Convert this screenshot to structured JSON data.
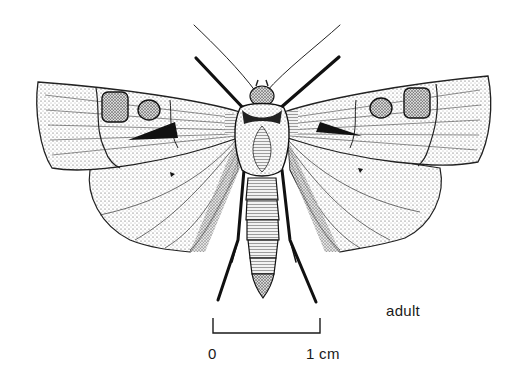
{
  "figure": {
    "view": "dorsal, wings spread",
    "style": "stippled pen-and-ink illustration",
    "stage_label": "adult"
  },
  "scale_bar": {
    "start_label": "0",
    "end_label": "1 cm"
  },
  "colors": {
    "background": "#ffffff",
    "ink": "#1a1a1a"
  }
}
